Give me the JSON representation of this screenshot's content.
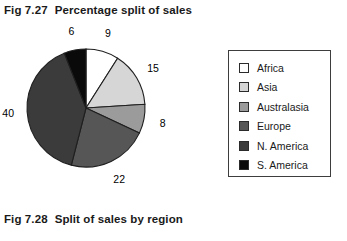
{
  "figure_top": {
    "number": "Fig 7.27",
    "title": "Percentage split of sales"
  },
  "figure_bottom": {
    "number": "Fig 7.28",
    "title": "Split of sales by region"
  },
  "legend": {
    "items": [
      {
        "label": "Africa",
        "color": "#ffffff"
      },
      {
        "label": "Asia",
        "color": "#d6d6d6"
      },
      {
        "label": "Australasia",
        "color": "#9b9b9b"
      },
      {
        "label": "Europe",
        "color": "#565656"
      },
      {
        "label": "N. America",
        "color": "#3b3b3b"
      },
      {
        "label": "S. America",
        "color": "#0a0a0a"
      }
    ]
  },
  "chart_data": {
    "type": "pie",
    "title": "Percentage split of sales",
    "categories": [
      "Africa",
      "Asia",
      "Australasia",
      "Europe",
      "N. America",
      "S. America"
    ],
    "values": [
      9,
      15,
      8,
      22,
      40,
      6
    ],
    "value_labels": [
      "9",
      "15",
      "8",
      "22",
      "40",
      "6"
    ],
    "colors": [
      "#ffffff",
      "#d6d6d6",
      "#9b9b9b",
      "#565656",
      "#3b3b3b",
      "#0a0a0a"
    ],
    "unit": "percent",
    "total": 100,
    "start_angle_deg": 0,
    "direction": "clockwise",
    "legend_position": "right",
    "grid": false,
    "xlabel": "",
    "ylabel": ""
  }
}
